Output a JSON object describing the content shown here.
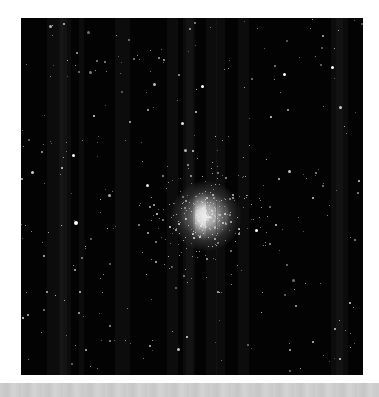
{
  "image": {
    "subject": "globular star cluster",
    "background_color": "#030303",
    "page_background": "#ffffff",
    "bottom_bar_color": "#cbcbcb"
  }
}
